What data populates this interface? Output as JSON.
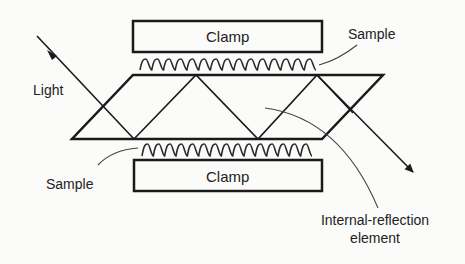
{
  "diagram": {
    "type": "attenuated-total-reflection-setup",
    "labels": {
      "top_clamp": "Clamp",
      "bottom_clamp": "Clamp",
      "top_sample": "Sample",
      "bottom_sample": "Sample",
      "light": "Light",
      "ire_line1": "Internal-reflection",
      "ire_line2": "element"
    },
    "colors": {
      "line": "#1a1a1a",
      "leader": "#444444",
      "background": "#fbfbfa"
    },
    "geometry": {
      "top_clamp": {
        "x": 133,
        "y": 21,
        "w": 189,
        "h": 31
      },
      "bottom_clamp": {
        "x": 134,
        "y": 160,
        "w": 188,
        "h": 31
      },
      "crystal": {
        "top_y": 75,
        "bottom_y": 139,
        "top_left_x": 133,
        "top_right_x": 383,
        "bottom_left_x": 72,
        "bottom_right_x": 322
      },
      "top_wave": {
        "x1": 140,
        "x2": 316,
        "y_top": 59,
        "y_bottom": 70,
        "periods": 15
      },
      "bottom_wave": {
        "x1": 142,
        "x2": 312,
        "y_top": 144,
        "y_bottom": 156,
        "periods": 15
      }
    }
  }
}
